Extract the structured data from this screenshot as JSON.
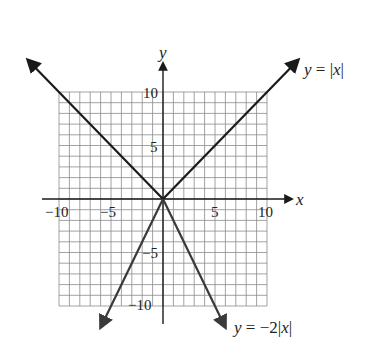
{
  "chart_data": {
    "type": "line",
    "title": "",
    "xlabel": "x",
    "ylabel": "y",
    "xlim": [
      -10,
      10
    ],
    "ylim": [
      -10,
      10
    ],
    "grid": true,
    "grid_step": 1,
    "x_ticks": [
      -10,
      -5,
      5,
      10
    ],
    "y_ticks": [
      10,
      5,
      -5,
      -10
    ],
    "x_tick_labels": [
      "−10",
      "−5",
      "5",
      "10"
    ],
    "y_tick_labels": [
      "10",
      "5",
      "−5",
      "−10"
    ],
    "series": [
      {
        "name": "y = |x|",
        "label": "y = |x|",
        "x": [
          -13,
          0,
          13
        ],
        "y": [
          13,
          0,
          13
        ],
        "color": "#1a1a1a"
      },
      {
        "name": "y = −2|x|",
        "label": "y = −2|x|",
        "x": [
          -6,
          0,
          6
        ],
        "y": [
          -12,
          0,
          -12
        ],
        "color": "#3a3a3a"
      }
    ],
    "annotations": [
      {
        "text": "y = |x|",
        "near": "upper-right arrow"
      },
      {
        "text": "y = −2|x|",
        "near": "lower-right arrow"
      }
    ],
    "legend": "none (inline labels)"
  },
  "labels": {
    "x_axis": "x",
    "y_axis": "y",
    "eq1_lhs": "y",
    "eq1_rest": " = |",
    "eq1_var": "x",
    "eq1_end": "|",
    "eq2_lhs": "y",
    "eq2_rest": " = −2|",
    "eq2_var": "x",
    "eq2_end": "|",
    "tick_x_neg10": "−10",
    "tick_x_neg5": "−5",
    "tick_x_5": "5",
    "tick_x_10": "10",
    "tick_y_10": "10",
    "tick_y_5": "5",
    "tick_y_neg5": "−5",
    "tick_y_neg10": "−10"
  },
  "colors": {
    "grid": "#8a8a8a",
    "axis": "#1a1a1a",
    "line1": "#1a1a1a",
    "line2": "#3a3a3a",
    "background": "#ffffff"
  }
}
